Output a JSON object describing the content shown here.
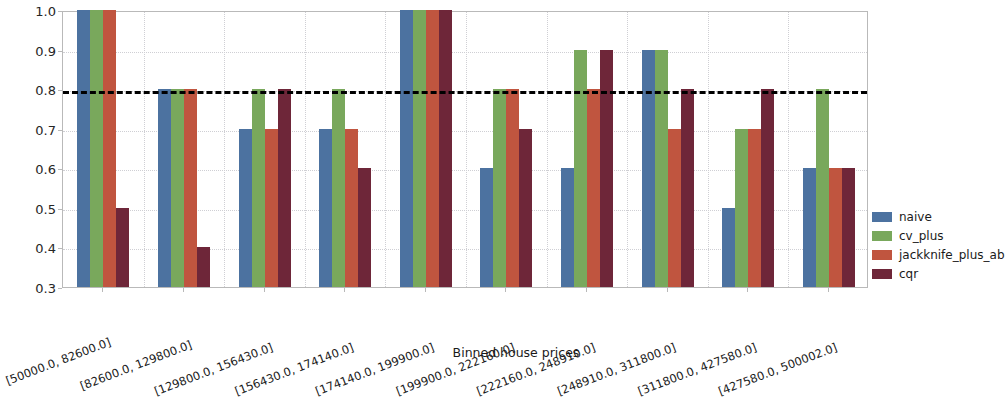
{
  "chart_data": {
    "type": "bar",
    "title": "",
    "xlabel": "Binned house prices",
    "ylabel": "Conditional coverage",
    "ylim": [
      0.3,
      1.0
    ],
    "yticks": [
      "0.3",
      "0.4",
      "0.5",
      "0.6",
      "0.7",
      "0.8",
      "0.9",
      "1.0"
    ],
    "ytick_values": [
      0.3,
      0.4,
      0.5,
      0.6,
      0.7,
      0.8,
      0.9,
      1.0
    ],
    "grid": true,
    "legend_position": "right",
    "categories": [
      "[50000.0, 82600.0]",
      "[82600.0, 129800.0]",
      "[129800.0, 156430.0]",
      "[156430.0, 174140.0]",
      "[174140.0, 199900.0]",
      "[199900.0, 222160.0]",
      "[222160.0, 248910.0]",
      "[248910.0, 311800.0]",
      "[311800.0, 427580.0]",
      "[427580.0, 500002.0]"
    ],
    "series": [
      {
        "name": "naive",
        "color": "#4c72a0",
        "values": [
          1.0,
          0.8,
          0.7,
          0.7,
          1.0,
          0.6,
          0.6,
          0.9,
          0.5,
          0.6
        ]
      },
      {
        "name": "cv_plus",
        "color": "#79a85c",
        "values": [
          1.0,
          0.8,
          0.8,
          0.8,
          1.0,
          0.8,
          0.9,
          0.9,
          0.7,
          0.8
        ]
      },
      {
        "name": "jackknife_plus_ab",
        "color": "#c0553f",
        "values": [
          1.0,
          0.8,
          0.7,
          0.7,
          1.0,
          0.8,
          0.8,
          0.7,
          0.7,
          0.6
        ]
      },
      {
        "name": "cqr",
        "color": "#6e2639",
        "values": [
          0.5,
          0.4,
          0.8,
          0.6,
          1.0,
          0.7,
          0.9,
          0.8,
          0.8,
          0.6
        ]
      }
    ],
    "annotations": [
      {
        "name": "target-coverage-line",
        "type": "hline",
        "value": 0.8,
        "style": "dashed",
        "color": "#000000"
      }
    ]
  }
}
